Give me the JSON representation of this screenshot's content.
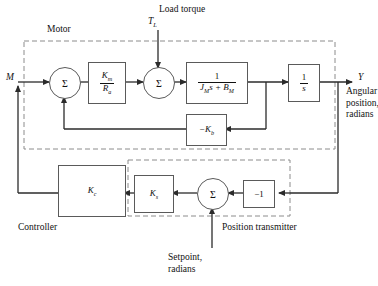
{
  "diagram": {
    "groups": [
      {
        "name": "motor",
        "label": "Motor"
      },
      {
        "name": "position-transmitter",
        "label": "Position transmitter"
      },
      {
        "name": "controller",
        "label": "Controller"
      }
    ],
    "signals": {
      "input_m": "M",
      "load_torque_symbol": "T",
      "load_torque_symbol_sub": "L",
      "load_torque_label": "Load torque",
      "output_y": "Y",
      "output_description_line1": "Angular",
      "output_description_line2": "position,",
      "output_description_line3": "radians",
      "setpoint_line1": "Setpoint,",
      "setpoint_line2": "radians"
    },
    "blocks": [
      {
        "name": "gain-km-ra",
        "type": "fraction",
        "numerator": "K",
        "numerator_sub": "m",
        "denominator": "R",
        "denominator_sub": "a"
      },
      {
        "name": "motor-dynamics",
        "type": "fraction",
        "numerator": "1",
        "denominator_pre": "J",
        "denominator_sub": "M",
        "denominator_mid": "s + B",
        "denominator_sub2": "M"
      },
      {
        "name": "integrator",
        "type": "fraction",
        "numerator": "1",
        "denominator": "s"
      },
      {
        "name": "back-emf-gain",
        "type": "plain",
        "text": "−K",
        "text_sub": "b"
      },
      {
        "name": "controller-gain",
        "type": "plain",
        "text": "K",
        "text_sub": "c"
      },
      {
        "name": "sensor-gain",
        "type": "plain",
        "text": "K",
        "text_sub": "s"
      },
      {
        "name": "inverter-gain",
        "type": "plain",
        "text": "−1"
      }
    ],
    "summers": [
      {
        "name": "summing-junction-1",
        "symbol": "Σ"
      },
      {
        "name": "summing-junction-2",
        "symbol": "Σ"
      },
      {
        "name": "summing-junction-3",
        "symbol": "Σ"
      }
    ],
    "colors": {
      "line": "#2b2b2b",
      "block_border": "#5a5a5a",
      "dashed_border": "#8c8c8c",
      "background": "#ffffff",
      "text": "#111111"
    }
  }
}
